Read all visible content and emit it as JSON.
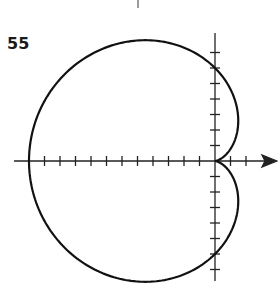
{
  "problem_number": "55",
  "chart_data": {
    "type": "line",
    "subtype": "polar",
    "title": "",
    "equation": "r = 6(1 - cos θ)",
    "xlabel": "",
    "ylabel": "",
    "tick_spacing": 1,
    "x_ticks": [
      -12,
      -11,
      -10,
      -9,
      -8,
      -7,
      -6,
      -5,
      -4,
      -3,
      -2,
      -1,
      1,
      2
    ],
    "y_ticks": [
      -7,
      -6,
      -5,
      -4,
      -3,
      -2,
      -1,
      1,
      2,
      3,
      4,
      5,
      6,
      7
    ],
    "xlim": [
      -13,
      4
    ],
    "ylim": [
      -8,
      8
    ],
    "key_points": [
      {
        "label": "pole (cusp)",
        "x": 0,
        "y": 0
      },
      {
        "label": "leftmost",
        "x": -12,
        "y": 0
      },
      {
        "label": "y-intercept top",
        "x": 0,
        "y": 6
      },
      {
        "label": "y-intercept bottom",
        "x": 0,
        "y": -6
      }
    ],
    "grid": false,
    "legend": null
  },
  "colors": {
    "curve": "#111111",
    "axes": "#222222",
    "background": "#ffffff"
  }
}
